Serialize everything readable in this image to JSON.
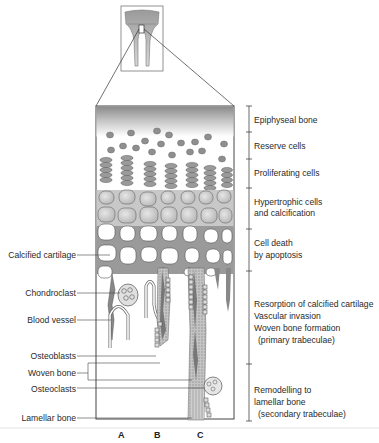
{
  "diagram": {
    "inset": {
      "description": "Long bone with epiphysis, growth plate region boxed"
    },
    "zones": [
      {
        "label": "Epiphyseal bone"
      },
      {
        "label": "Reserve cells"
      },
      {
        "label": "Proliferating cells"
      },
      {
        "label": "Hypertrophic cells",
        "label2": "and calcification"
      },
      {
        "label": "Cell death",
        "label2": "by apoptosis"
      },
      {
        "label": "Resorption of calcified cartilage",
        "label2": "Vascular invasion",
        "label3": "Woven bone formation",
        "label4": "(primary trabeculae)"
      },
      {
        "label": "Remodelling to",
        "label2": "lamellar bone",
        "label3": "(secondary trabeculae)"
      }
    ],
    "left_labels": [
      {
        "label": "Calcified cartilage"
      },
      {
        "label": "Chondroclast"
      },
      {
        "label": "Blood vessel"
      },
      {
        "label": "Osteoblasts"
      },
      {
        "label": "Woven bone"
      },
      {
        "label": "Osteoclasts"
      },
      {
        "label": "Lamellar bone"
      }
    ],
    "columns": [
      "A",
      "B",
      "C"
    ],
    "colors": {
      "cartilage_gray": "#9a9a9a",
      "cell_fill": "#cfcfcf",
      "bone_pattern": "#b5b5b5",
      "outline": "#555555"
    }
  }
}
